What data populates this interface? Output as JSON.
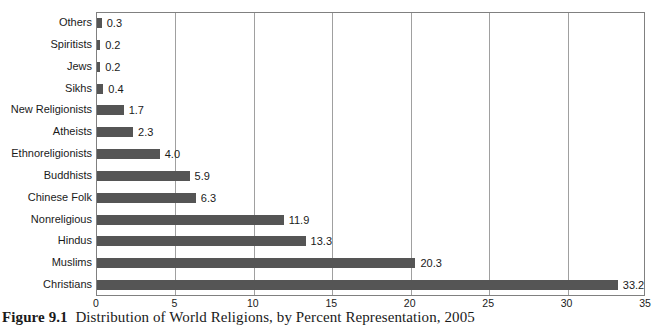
{
  "caption": {
    "figure_number": "Figure 9.1",
    "text": "Distribution of World Religions, by Percent Representation, 2005"
  },
  "axis": {
    "ticks": [
      "0",
      "5",
      "10",
      "15",
      "20",
      "25",
      "30",
      "35"
    ]
  },
  "colors": {
    "bar": "#555555",
    "gridline": "#a0a0a0",
    "frame": "#808080",
    "text": "#1a1a1a"
  },
  "chart_data": {
    "type": "bar",
    "orientation": "horizontal",
    "xlabel": "",
    "ylabel": "",
    "xlim": [
      0,
      35
    ],
    "grid": true,
    "legend": "none",
    "categories": [
      "Others",
      "Spiritists",
      "Jews",
      "Sikhs",
      "New Religionists",
      "Atheists",
      "Ethnoreligionists",
      "Buddhists",
      "Chinese Folk",
      "Nonreligious",
      "Hindus",
      "Muslims",
      "Christians"
    ],
    "values": [
      0.3,
      0.2,
      0.2,
      0.4,
      1.7,
      2.3,
      4.0,
      5.9,
      6.3,
      11.9,
      13.3,
      20.3,
      33.2
    ],
    "value_labels": [
      "0.3",
      "0.2",
      "0.2",
      "0.4",
      "1.7",
      "2.3",
      "4.0",
      "5.9",
      "6.3",
      "11.9",
      "13.3",
      "20.3",
      "33.2"
    ],
    "xticks": [
      0,
      5,
      10,
      15,
      20,
      25,
      30,
      35
    ]
  }
}
